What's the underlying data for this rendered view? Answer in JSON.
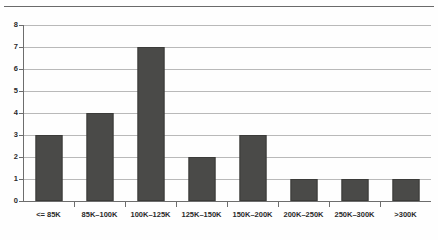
{
  "chart_data": {
    "type": "bar",
    "title": "",
    "subtitle": "",
    "xlabel": "",
    "ylabel": "",
    "categories": [
      "<= 85K",
      "85K–100K",
      "100K–125K",
      "125K–150K",
      "150K–200K",
      "200K–250K",
      "250K–300K",
      ">300K"
    ],
    "values": [
      3,
      4,
      7,
      2,
      3,
      1,
      1,
      1
    ],
    "ylim": [
      0,
      8
    ],
    "ytick_labels": [
      "0",
      "1",
      "2",
      "3",
      "4",
      "5",
      "6",
      "7",
      "8"
    ],
    "ytick_values": [
      0,
      1,
      2,
      3,
      4,
      5,
      6,
      7,
      8
    ],
    "grid": "horizontal",
    "legend": "none",
    "bar_color": "#4a4a48",
    "gridline_color": "#b9b9b9",
    "axis_color": "#6d6d6d",
    "background_color": "#fefefe",
    "annotations": []
  }
}
